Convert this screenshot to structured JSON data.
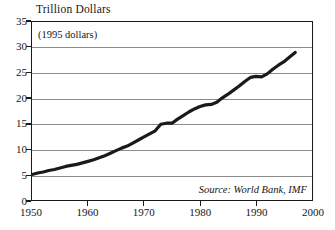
{
  "chart_data": {
    "type": "line",
    "title": "Trillion Dollars",
    "subtitle": "(1995 dollars)",
    "annotation": "Source: World Bank, IMF",
    "xlabel": "",
    "ylabel": "Trillion Dollars",
    "xlim": [
      1950,
      2000
    ],
    "ylim": [
      0,
      35
    ],
    "grid": "horizontal",
    "legend": "none",
    "line_color": "#1a1a1a",
    "grid_color": "#8c8c8c",
    "axis_color": "#1a1a1a",
    "background_color": "#ffffff",
    "xticks": [
      1950,
      1960,
      1970,
      1980,
      1990,
      2000
    ],
    "yticks": [
      0,
      5,
      10,
      15,
      20,
      25,
      30,
      35
    ],
    "xtick_labels": [
      "1950",
      "1960",
      "1970",
      "1980",
      "1990",
      "2000"
    ],
    "ytick_labels": [
      "0",
      "5",
      "10",
      "15",
      "20",
      "25",
      "30",
      "35"
    ],
    "series": [
      {
        "name": "Gross World Product",
        "x": [
          1950,
          1951,
          1952,
          1953,
          1954,
          1955,
          1956,
          1957,
          1958,
          1959,
          1960,
          1961,
          1962,
          1963,
          1964,
          1965,
          1966,
          1967,
          1968,
          1969,
          1970,
          1971,
          1972,
          1973,
          1974,
          1975,
          1976,
          1977,
          1978,
          1979,
          1980,
          1981,
          1982,
          1983,
          1984,
          1985,
          1986,
          1987,
          1988,
          1989,
          1990,
          1991,
          1992,
          1993,
          1994,
          1995,
          1996,
          1997
        ],
        "y": [
          5.0,
          5.3,
          5.5,
          5.8,
          6.0,
          6.3,
          6.6,
          6.8,
          7.0,
          7.3,
          7.6,
          7.9,
          8.3,
          8.7,
          9.2,
          9.7,
          10.2,
          10.6,
          11.2,
          11.8,
          12.4,
          13.0,
          13.6,
          14.9,
          15.1,
          15.1,
          15.9,
          16.6,
          17.3,
          17.9,
          18.4,
          18.7,
          18.8,
          19.2,
          20.1,
          20.8,
          21.6,
          22.4,
          23.3,
          24.1,
          24.3,
          24.2,
          24.8,
          25.7,
          26.5,
          27.2,
          28.1,
          29.0
        ]
      }
    ]
  },
  "figure": {
    "title": "Trillion Dollars",
    "subtitle": "(1995 dollars)",
    "source": "Source: World Bank, IMF"
  }
}
